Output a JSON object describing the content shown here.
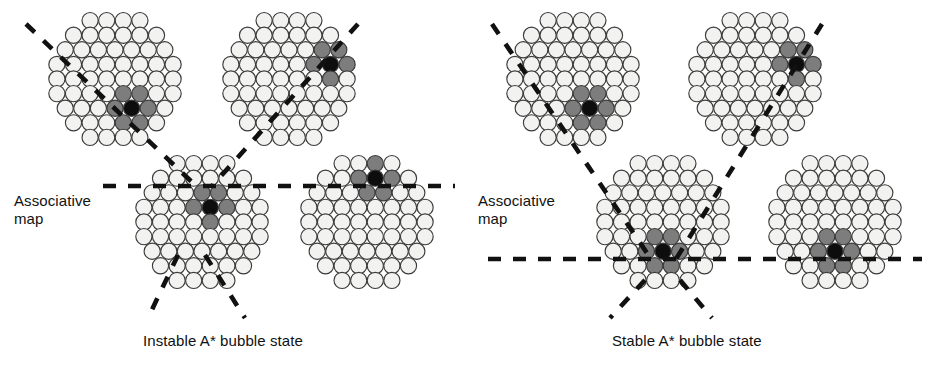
{
  "figure": {
    "title_text_present": false,
    "background": "#ffffff",
    "width": 928,
    "height": 366
  },
  "colors": {
    "cell_fill": "#f2f2f0",
    "cell_stroke": "#3b3b3b",
    "cell_gray": "#7d7d7d",
    "cell_black": "#0d0d0d",
    "dash_line": "#111111",
    "text": "#111111"
  },
  "panels": [
    {
      "id": "left-panel",
      "label": "Associative\nmap",
      "label_x": 14,
      "label_y": 192,
      "caption": "Instable A* bubble state",
      "caption_x": 143,
      "caption_y": 332,
      "maps": [
        {
          "id": "left-top-left-map",
          "cx": 115,
          "cy": 79,
          "rows": 9,
          "bubble_col": 1,
          "bubble_row": 5,
          "bubble_center": "#0d0d0d",
          "bubble_neighbors": "#7d7d7d"
        },
        {
          "id": "left-top-right-map",
          "cx": 289,
          "cy": 79,
          "rows": 9,
          "bubble_col": 2,
          "bubble_row": 1,
          "bubble_center": "#0d0d0d",
          "bubble_neighbors": "#7d7d7d"
        },
        {
          "id": "left-bottom-left-map",
          "cx": 202,
          "cy": 222,
          "rows": 9,
          "bubble_col": 0,
          "bubble_row": 1,
          "bubble_center": "#0d0d0d",
          "bubble_neighbors": "#7d7d7d"
        },
        {
          "id": "left-bottom-right-map",
          "cx": 367,
          "cy": 222,
          "rows": 9,
          "bubble_col": 0,
          "bubble_row": -2,
          "bubble_center": "#0d0d0d",
          "bubble_neighbors": "#7d7d7d"
        }
      ],
      "horizontal_line": {
        "y": 186,
        "x1": 103,
        "x2": 455
      },
      "diagonals": [
        {
          "x1": 26,
          "y1": 24,
          "x2": 196,
          "y2": 186
        },
        {
          "x1": 358,
          "y1": 24,
          "x2": 212,
          "y2": 186
        },
        {
          "x1": 178,
          "y1": 255,
          "x2": 148,
          "y2": 318
        },
        {
          "x1": 205,
          "y1": 255,
          "x2": 245,
          "y2": 318
        }
      ]
    },
    {
      "id": "right-panel",
      "label": "Associative\nmap",
      "label_x": 478,
      "label_y": 192,
      "caption": "Stable A* bubble state",
      "caption_x": 612,
      "caption_y": 332,
      "maps": [
        {
          "id": "right-top-left-map",
          "cx": 573,
          "cy": 79,
          "rows": 9,
          "bubble_col": 1,
          "bubble_row": 5,
          "bubble_center": "#0d0d0d",
          "bubble_neighbors": "#7d7d7d"
        },
        {
          "id": "right-top-right-map",
          "cx": 755,
          "cy": 79,
          "rows": 9,
          "bubble_col": 2,
          "bubble_row": 1,
          "bubble_center": "#0d0d0d",
          "bubble_neighbors": "#7d7d7d"
        },
        {
          "id": "right-bottom-left-map",
          "cx": 663,
          "cy": 222,
          "rows": 9,
          "bubble_col": 0,
          "bubble_row": 4,
          "bubble_center": "#0d0d0d",
          "bubble_neighbors": "#7d7d7d"
        },
        {
          "id": "right-bottom-right-map",
          "cx": 835,
          "cy": 222,
          "rows": 9,
          "bubble_col": 0,
          "bubble_row": 4,
          "bubble_center": "#0d0d0d",
          "bubble_neighbors": "#7d7d7d"
        }
      ],
      "horizontal_line": {
        "y": 259,
        "x1": 488,
        "x2": 922
      },
      "diagonals": [
        {
          "x1": 492,
          "y1": 24,
          "x2": 651,
          "y2": 259
        },
        {
          "x1": 822,
          "y1": 24,
          "x2": 676,
          "y2": 259
        },
        {
          "x1": 645,
          "y1": 280,
          "x2": 610,
          "y2": 318
        },
        {
          "x1": 680,
          "y1": 280,
          "x2": 712,
          "y2": 318
        }
      ]
    }
  ],
  "legend_semantics": {
    "cell_white_meaning": "inactive neuron",
    "cell_gray_meaning": "partially active neuron",
    "cell_black_meaning": "bubble center neuron"
  }
}
